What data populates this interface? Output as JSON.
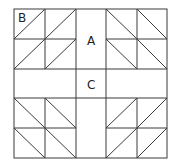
{
  "diagram": {
    "labels": {
      "A": "A",
      "B": "B",
      "C": "C"
    },
    "colors": {
      "line": "#3a3a3a",
      "background": "#ffffff",
      "text": "#222222"
    }
  }
}
